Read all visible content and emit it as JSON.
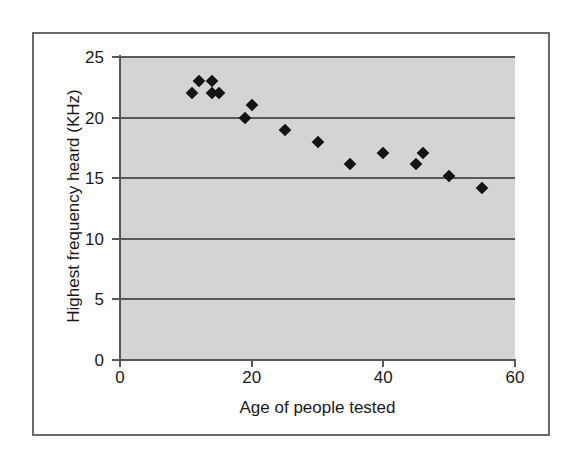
{
  "chart_data": {
    "type": "scatter",
    "title": "",
    "xlabel": "Age of people tested",
    "ylabel": "Highest frequency heard (KHz)",
    "xlim": [
      0,
      60
    ],
    "ylim": [
      0,
      25
    ],
    "xticks": [
      0,
      20,
      40,
      60
    ],
    "yticks": [
      0,
      5,
      10,
      15,
      20,
      25
    ],
    "xtick_labels": [
      "0",
      "20",
      "40",
      "60"
    ],
    "ytick_labels": [
      "0",
      "5",
      "10",
      "15",
      "20",
      "25"
    ],
    "grid": "horizontal",
    "legend": "none",
    "marker": "filled-black-diamond",
    "plot_background": "#d4d4d4",
    "axis_color": "#58585a",
    "marker_color": "#141414",
    "series": [
      {
        "name": "Highest frequency heard vs age",
        "points": [
          {
            "x": 11,
            "y": 22
          },
          {
            "x": 12,
            "y": 23
          },
          {
            "x": 14,
            "y": 23
          },
          {
            "x": 14,
            "y": 22
          },
          {
            "x": 15,
            "y": 22
          },
          {
            "x": 19,
            "y": 20
          },
          {
            "x": 20,
            "y": 21
          },
          {
            "x": 25,
            "y": 19
          },
          {
            "x": 30,
            "y": 18
          },
          {
            "x": 35,
            "y": 16.2
          },
          {
            "x": 40,
            "y": 17.1
          },
          {
            "x": 45,
            "y": 16.2
          },
          {
            "x": 46,
            "y": 17.1
          },
          {
            "x": 50,
            "y": 15.2
          },
          {
            "x": 55,
            "y": 14.2
          }
        ]
      }
    ]
  }
}
